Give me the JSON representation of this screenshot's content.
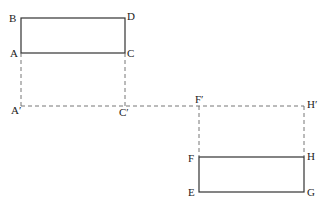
{
  "diagram": {
    "rectangles": [
      {
        "name": "ABCD",
        "corners": {
          "B": [
            21,
            18
          ],
          "D": [
            125,
            18
          ],
          "C": [
            125,
            53
          ],
          "A": [
            21,
            53
          ]
        }
      },
      {
        "name": "EFGH",
        "corners": {
          "F": [
            199,
            157
          ],
          "H": [
            304,
            157
          ],
          "G": [
            304,
            192
          ],
          "E": [
            199,
            192
          ]
        }
      }
    ],
    "dashed_projection_line": {
      "from": [
        21,
        106
      ],
      "to": [
        304,
        106
      ]
    },
    "labels": {
      "B": "B",
      "D": "D",
      "A": "A",
      "C": "C",
      "A_prime": "A′",
      "C_prime": "C′",
      "F_prime": "F′",
      "H_prime": "H′",
      "F": "F",
      "H": "H",
      "E": "E",
      "G": "G"
    }
  }
}
